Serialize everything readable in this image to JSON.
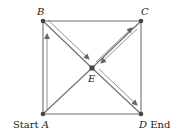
{
  "diagram": {
    "type": "graph",
    "nodes": [
      {
        "id": "A",
        "label": "A",
        "prefix": "Start ",
        "x": 43,
        "y": 114
      },
      {
        "id": "B",
        "label": "B",
        "x": 43,
        "y": 21
      },
      {
        "id": "C",
        "label": "C",
        "x": 141,
        "y": 21
      },
      {
        "id": "D",
        "label": "D",
        "suffix": " End",
        "x": 141,
        "y": 114
      },
      {
        "id": "E",
        "label": "E",
        "x": 92,
        "y": 68
      }
    ],
    "edges": [
      [
        "A",
        "B"
      ],
      [
        "B",
        "C"
      ],
      [
        "C",
        "D"
      ],
      [
        "A",
        "D"
      ],
      [
        "A",
        "E"
      ],
      [
        "B",
        "E"
      ],
      [
        "C",
        "E"
      ],
      [
        "D",
        "E"
      ]
    ],
    "path_arrows": [
      {
        "from": "A",
        "to": "B"
      },
      {
        "from": "B",
        "to": "E"
      },
      {
        "from": "E",
        "to": "C"
      },
      {
        "from": "C",
        "to": "E"
      },
      {
        "from": "E",
        "to": "D"
      }
    ],
    "labels": {
      "b": "B",
      "c": "C",
      "e": "E",
      "start_prefix": "Start ",
      "a": "A",
      "d": "D",
      "end_suffix": " End"
    },
    "colors": {
      "edge": "#6e6e6e",
      "node": "#444444",
      "arrow": "#777777",
      "text": "#222222"
    }
  }
}
